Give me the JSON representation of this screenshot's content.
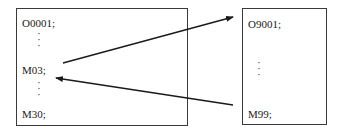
{
  "main_program": {
    "lines": [
      "O0001;",
      "⋮",
      "M03;",
      "⋮",
      "M30;"
    ]
  },
  "subprogram": {
    "lines": [
      "O9001;",
      "⋮",
      "M99;"
    ]
  },
  "arrows": [
    {
      "from": "M03;",
      "to": "O9001;",
      "label": "call subprogram"
    },
    {
      "from": "M99;",
      "to": "main program after M03",
      "label": "return"
    }
  ]
}
